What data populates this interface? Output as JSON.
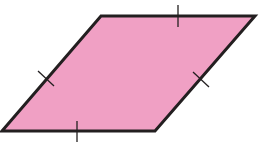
{
  "figure": {
    "shape": "rhombus",
    "title": "Rhombus with four congruent sides",
    "fill_color": "#F0A0C4",
    "stroke_color": "#231F20",
    "vertices": [
      [
        101,
        16
      ],
      [
        255,
        16
      ],
      [
        155,
        131
      ],
      [
        2,
        131
      ]
    ],
    "tick_marks": [
      {
        "side": "top",
        "x1": 178,
        "y1": 5,
        "x2": 178,
        "y2": 27
      },
      {
        "side": "right",
        "x1": 193,
        "y1": 72,
        "x2": 209,
        "y2": 87
      },
      {
        "side": "bottom",
        "x1": 77,
        "y1": 121,
        "x2": 77,
        "y2": 142
      },
      {
        "side": "left",
        "x1": 38,
        "y1": 71,
        "x2": 54,
        "y2": 86
      }
    ]
  }
}
